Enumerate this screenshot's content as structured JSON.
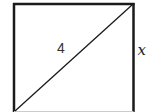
{
  "diagram": {
    "shape": "square",
    "diagonal_label": "4",
    "side_label": "x",
    "stroke_color": "#1a1a1a",
    "background": "#ffffff"
  }
}
